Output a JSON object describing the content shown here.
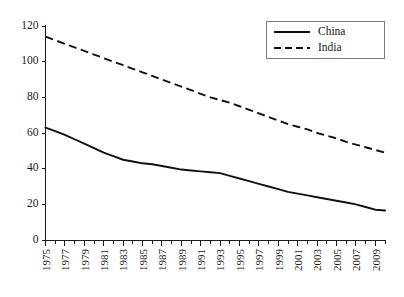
{
  "chart_data": {
    "type": "line",
    "title": "",
    "subtitle": "",
    "xlabel": "",
    "ylabel": "",
    "xlim": [
      1975,
      2010
    ],
    "ylim": [
      0,
      120
    ],
    "grid": false,
    "legend_position": "top-right",
    "ytick_labels": [
      "0",
      "20",
      "40",
      "60",
      "80",
      "100",
      "120"
    ],
    "ytick_values": [
      0,
      20,
      40,
      60,
      80,
      100,
      120
    ],
    "xtick_labels": [
      "1975",
      "1977",
      "1979",
      "1981",
      "1983",
      "1985",
      "1987",
      "1989",
      "1991",
      "1993",
      "1995",
      "1997",
      "1999",
      "2001",
      "2003",
      "2005",
      "2007",
      "2009"
    ],
    "xtick_values": [
      1975,
      1977,
      1979,
      1981,
      1983,
      1985,
      1987,
      1989,
      1991,
      1993,
      1995,
      1997,
      1999,
      2001,
      2003,
      2005,
      2007,
      2009
    ],
    "x": [
      1975,
      1976,
      1977,
      1978,
      1979,
      1980,
      1981,
      1982,
      1983,
      1984,
      1985,
      1986,
      1987,
      1988,
      1989,
      1990,
      1991,
      1992,
      1993,
      1994,
      1995,
      1996,
      1997,
      1998,
      1999,
      2000,
      2001,
      2002,
      2003,
      2004,
      2005,
      2006,
      2007,
      2008,
      2009,
      2010
    ],
    "series": [
      {
        "name": "China",
        "style": "solid",
        "color": "#111111",
        "values": [
          63,
          61,
          59,
          56.5,
          54,
          51.5,
          49,
          47,
          45,
          44,
          43,
          42.5,
          41.5,
          40.5,
          39.5,
          39,
          38.5,
          38,
          37.5,
          36,
          34.5,
          33,
          31.5,
          30,
          28.5,
          27,
          26,
          25,
          24,
          23,
          22,
          21,
          20,
          18.5,
          17,
          16.5
        ]
      },
      {
        "name": "India",
        "style": "dashed",
        "color": "#111111",
        "values": [
          114,
          112,
          110,
          108,
          106,
          104,
          102,
          100,
          98,
          96,
          94,
          92,
          90,
          88,
          86,
          84,
          82,
          80,
          78.5,
          77,
          75,
          73,
          71,
          69,
          67,
          65,
          63.5,
          62,
          60,
          58.5,
          57,
          55,
          53.5,
          52,
          50.5,
          49
        ]
      }
    ]
  },
  "legend": {
    "entries": [
      {
        "label": "China",
        "style": "solid"
      },
      {
        "label": "India",
        "style": "dashed"
      }
    ]
  },
  "colors": {
    "line": "#111111",
    "axis": "#1a1a1a",
    "legend_border": "#7a7a7a",
    "background": "#ffffff"
  }
}
